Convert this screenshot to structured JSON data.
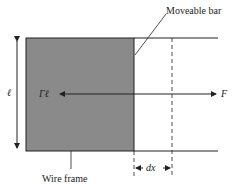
{
  "diagram": {
    "labels": {
      "moveable_bar": "Moveable bar",
      "wire_frame": "Wire frame",
      "length": "ℓ",
      "surface_force": "Γℓ",
      "applied_force": "F",
      "displacement": "dx"
    },
    "colors": {
      "film": "#8a8a8a",
      "line": "#222222"
    }
  }
}
